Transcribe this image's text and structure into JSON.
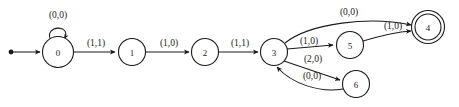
{
  "diagram": {
    "type": "state-transition-diagram",
    "colors": {
      "stroke": "#1a1a1a",
      "fill": "#ffffff",
      "background": "#ffffff"
    },
    "start_marker": "start-dot",
    "states": [
      {
        "id": "0",
        "label": "0",
        "cx": 58,
        "cy": 52,
        "r": 15.5,
        "accepting": false,
        "initial": true
      },
      {
        "id": "1",
        "label": "1",
        "cx": 132,
        "cy": 52,
        "r": 13.5,
        "accepting": false,
        "initial": false
      },
      {
        "id": "2",
        "label": "2",
        "cx": 205,
        "cy": 52,
        "r": 13.5,
        "accepting": false,
        "initial": false
      },
      {
        "id": "3",
        "label": "3",
        "cx": 274,
        "cy": 52,
        "r": 13.5,
        "accepting": false,
        "initial": false
      },
      {
        "id": "5",
        "label": "5",
        "cx": 350,
        "cy": 45,
        "r": 13.5,
        "accepting": false,
        "initial": false
      },
      {
        "id": "6",
        "label": "6",
        "cx": 356,
        "cy": 84,
        "r": 13.5,
        "accepting": false,
        "initial": false
      },
      {
        "id": "4",
        "label": "4",
        "cx": 428,
        "cy": 27,
        "r": 13.5,
        "accepting": true,
        "initial": false
      }
    ],
    "transitions": [
      {
        "from": "0",
        "to": "0",
        "label": "(0,0)",
        "kind": "self-loop",
        "label_x": 58,
        "label_y": 15
      },
      {
        "from": "0",
        "to": "1",
        "label": "(1,1)",
        "kind": "straight",
        "label_x": 96,
        "label_y": 44
      },
      {
        "from": "1",
        "to": "2",
        "label": "(1,0)",
        "kind": "straight",
        "label_x": 169,
        "label_y": 44
      },
      {
        "from": "2",
        "to": "3",
        "label": "(1,1)",
        "kind": "straight",
        "label_x": 240,
        "label_y": 44
      },
      {
        "from": "3",
        "to": "4",
        "label": "(0,0)",
        "kind": "curve-up",
        "label_x": 349,
        "label_y": 13
      },
      {
        "from": "3",
        "to": "5",
        "label": "(1,0)",
        "kind": "straight",
        "label_x": 309,
        "label_y": 42
      },
      {
        "from": "5",
        "to": "4",
        "label": "(1,0)",
        "kind": "curve-up",
        "label_x": 392,
        "label_y": 26
      },
      {
        "from": "3",
        "to": "6",
        "label": "(2,0)",
        "kind": "straight",
        "label_x": 313,
        "label_y": 59
      },
      {
        "from": "6",
        "to": "3",
        "label": "(0,0)",
        "kind": "curve-back",
        "label_x": 313,
        "label_y": 77
      }
    ]
  }
}
